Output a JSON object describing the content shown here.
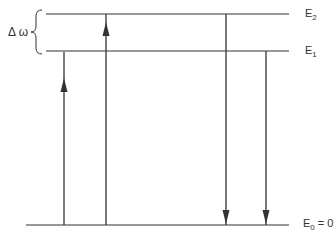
{
  "diagram": {
    "type": "energy-level-diagram",
    "bracket_label": "Δ ω",
    "levels": [
      {
        "name": "E2",
        "symbol": "E",
        "subscript": "2",
        "suffix": "",
        "y": 14
      },
      {
        "name": "E1",
        "symbol": "E",
        "subscript": "1",
        "suffix": "",
        "y": 51
      },
      {
        "name": "E0",
        "symbol": "E",
        "subscript": "0",
        "suffix": " = 0",
        "y": 225
      }
    ],
    "transitions": [
      {
        "direction": "up",
        "from": "E0",
        "to": "E1",
        "x": 64
      },
      {
        "direction": "up",
        "from": "E0",
        "to": "E2",
        "x": 106
      },
      {
        "direction": "down",
        "from": "E2",
        "to": "E0",
        "x": 226
      },
      {
        "direction": "down",
        "from": "E1",
        "to": "E0",
        "x": 266
      }
    ],
    "colors": {
      "line": "#333333",
      "background": "#ffffff"
    }
  }
}
